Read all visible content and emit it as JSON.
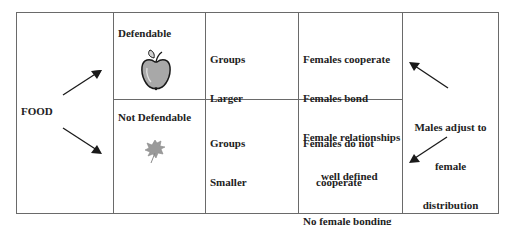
{
  "diagram": {
    "source_label": "FOOD",
    "rows": [
      {
        "food_type": "Defendable",
        "food_icon": "apple-icon",
        "group_size": [
          "Groups",
          "Larger"
        ],
        "female_behavior": [
          "Females cooperate",
          "Females bond",
          "Female relationships",
          "well defined"
        ]
      },
      {
        "food_type": "Not Defendable",
        "food_icon": "leaf-icon",
        "group_size": [
          "Groups",
          "Smaller"
        ],
        "female_behavior": [
          "Females do not",
          "cooperate",
          "No female bonding",
          "Loosely defined",
          "relationships"
        ]
      }
    ],
    "male_response": [
      "Males adjust to",
      "female",
      "distribution"
    ],
    "colors": {
      "grid_line": "#6a6a6a",
      "text": "#222222",
      "arrow": "#1a1a1a",
      "icon_fill": "#a8a8a8"
    }
  }
}
